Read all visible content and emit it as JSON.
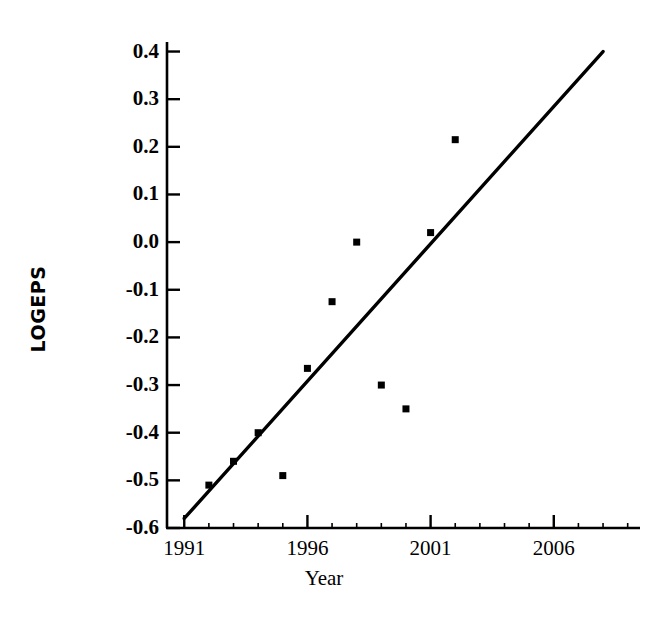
{
  "chart_data": {
    "type": "scatter",
    "title": "",
    "xlabel": "Year",
    "ylabel": "LOGEPS",
    "xlim": [
      1990.3,
      2009.5
    ],
    "ylim": [
      -0.6,
      0.42
    ],
    "grid": false,
    "legend": null,
    "x_ticks": [
      1991,
      1996,
      2001,
      2006
    ],
    "x_tick_labels": [
      "1991",
      "1996",
      "2001",
      "2006"
    ],
    "x_minor_tick_interval": 1,
    "y_ticks": [
      0.4,
      0.3,
      0.2,
      0.1,
      0.0,
      -0.1,
      -0.2,
      -0.3,
      -0.4,
      -0.5,
      -0.6
    ],
    "y_tick_labels": [
      "0.4",
      "0.3",
      "0.2",
      "0.1",
      "0.0",
      "-0.1",
      "-0.2",
      "-0.3",
      "-0.4",
      "-0.5",
      "-0.6"
    ],
    "marker": "square",
    "marker_color": "#000000",
    "series": [
      {
        "name": "LOGEPS",
        "x": [
          1992,
          1993,
          1994,
          1995,
          1996,
          1997,
          1998,
          1999,
          2000,
          2001,
          2002
        ],
        "values": [
          -0.51,
          -0.46,
          -0.4,
          -0.49,
          -0.265,
          -0.125,
          0.0,
          -0.3,
          -0.35,
          0.02,
          0.215
        ]
      }
    ],
    "trend_line": {
      "name": "fitted trend line",
      "color": "#000000",
      "x": [
        1991,
        2008
      ],
      "values": [
        -0.58,
        0.4
      ]
    }
  },
  "axis": {
    "y_title": "LOGEPS",
    "x_title": "Year"
  }
}
